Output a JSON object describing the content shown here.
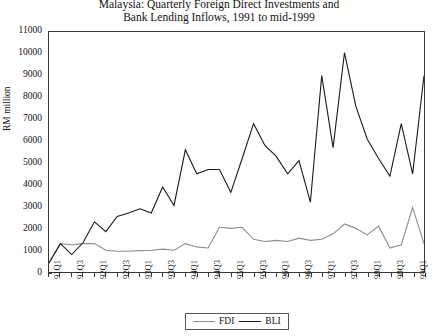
{
  "chart_data": {
    "type": "line",
    "title": "Malaysia: Quarterly Foreign Direct Investments and Bank Lending Inflows, 1991 to mid-1999",
    "title_lines": [
      "Malaysia: Quarterly Foreign Direct Investments and",
      "Bank Lending Inflows, 1991 to mid-1999"
    ],
    "xlabel": "",
    "ylabel": "RM million",
    "ylim": [
      0,
      11000
    ],
    "ytick_values": [
      0,
      1000,
      2000,
      3000,
      4000,
      5000,
      6000,
      7000,
      8000,
      9000,
      10000,
      11000
    ],
    "ytick_labels": [
      "0",
      "1000",
      "2000",
      "3000",
      "4000",
      "5000",
      "6000",
      "7000",
      "8000",
      "9000",
      "10000",
      "11000"
    ],
    "grid": false,
    "legend_position": "bottom-center",
    "x": [
      "91Q1",
      "91Q2",
      "91Q3",
      "91Q4",
      "92Q1",
      "92Q2",
      "92Q3",
      "92Q4",
      "93Q1",
      "93Q2",
      "93Q3",
      "93Q4",
      "94Q1",
      "94Q2",
      "94Q3",
      "94Q4",
      "95Q1",
      "95Q2",
      "95Q3",
      "95Q4",
      "96Q1",
      "96Q2",
      "96Q3",
      "96Q4",
      "97Q1",
      "97Q2",
      "97Q3",
      "97Q4",
      "98Q1",
      "98Q2",
      "98Q3",
      "98Q4",
      "99Q1",
      "99Q2"
    ],
    "xtick_labels": [
      "91Q1",
      "91Q3",
      "92Q1",
      "92Q3",
      "93Q1",
      "93Q3",
      "94Q1",
      "94Q3",
      "95Q1",
      "95Q3",
      "96Q1",
      "96Q3",
      "97Q1",
      "97Q3",
      "98Q1",
      "98Q3",
      "99Q1"
    ],
    "xtick_indices": [
      0,
      2,
      4,
      6,
      8,
      10,
      12,
      14,
      16,
      18,
      20,
      22,
      24,
      26,
      28,
      30,
      32
    ],
    "series": [
      {
        "name": "FDI",
        "color": "#8d8d8d",
        "values": [
          450,
          1300,
          1250,
          1300,
          1300,
          1000,
          950,
          950,
          980,
          1000,
          1050,
          1000,
          1300,
          1150,
          1100,
          2050,
          2000,
          2050,
          1500,
          1400,
          1450,
          1400,
          1550,
          1450,
          1500,
          1750,
          2200,
          2000,
          1700,
          2100,
          1100,
          1250,
          2950,
          1300
        ]
      },
      {
        "name": "BLI",
        "color": "#1a1a1a",
        "values": [
          400,
          1300,
          800,
          1350,
          2300,
          1850,
          2550,
          2700,
          2900,
          2700,
          3900,
          3050,
          5600,
          4500,
          4700,
          4700,
          3650,
          5200,
          6800,
          5800,
          5300,
          4500,
          5100,
          3200,
          9000,
          5700,
          10050,
          7600,
          6100,
          5200,
          4400,
          6800,
          4500,
          9000
        ]
      }
    ]
  },
  "legend": {
    "items": [
      {
        "label": "FDI"
      },
      {
        "label": "BLI"
      }
    ]
  }
}
